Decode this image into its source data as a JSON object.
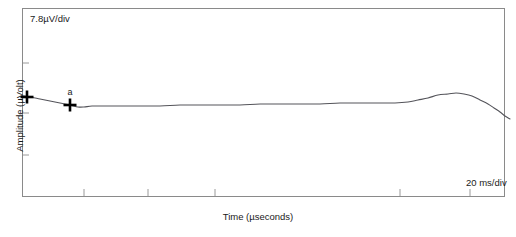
{
  "chart_data": {
    "type": "line",
    "title": "",
    "xlabel": "Time (µseconds)",
    "ylabel": "Amplitude (µVolt)",
    "vertical_scale_note": "7.8µV/div",
    "horizontal_scale_note": "20 ms/div",
    "grid": false,
    "legend": "none",
    "trace_color": "#54545a",
    "frame_color": "#8a8a8a",
    "background_color": "#ffffff",
    "xlim": [
      0,
      100
    ],
    "ylim": [
      -5,
      5
    ],
    "axis_ticks": {
      "y_tick_positions_px": [
        63,
        97,
        113,
        155
      ],
      "x_tick_positions_px": [
        84,
        148,
        215,
        400,
        470
      ]
    },
    "series": [
      {
        "name": "waveform",
        "points_px": [
          [
            23,
            96
          ],
          [
            30,
            97
          ],
          [
            40,
            99
          ],
          [
            50,
            101
          ],
          [
            60,
            103
          ],
          [
            70,
            105
          ],
          [
            78,
            107
          ],
          [
            84,
            107
          ],
          [
            92,
            106
          ],
          [
            104,
            106
          ],
          [
            120,
            106
          ],
          [
            140,
            106
          ],
          [
            160,
            106
          ],
          [
            180,
            105
          ],
          [
            200,
            105
          ],
          [
            220,
            105
          ],
          [
            240,
            105
          ],
          [
            260,
            104
          ],
          [
            280,
            104
          ],
          [
            300,
            104
          ],
          [
            320,
            104
          ],
          [
            340,
            103
          ],
          [
            360,
            103
          ],
          [
            380,
            103
          ],
          [
            395,
            103
          ],
          [
            408,
            102
          ],
          [
            418,
            100
          ],
          [
            428,
            98
          ],
          [
            438,
            95
          ],
          [
            448,
            94
          ],
          [
            456,
            93
          ],
          [
            464,
            94
          ],
          [
            472,
            96
          ],
          [
            480,
            100
          ],
          [
            488,
            104
          ],
          [
            494,
            108
          ],
          [
            500,
            112
          ],
          [
            505,
            116
          ],
          [
            510,
            119
          ]
        ]
      }
    ],
    "markers": [
      {
        "name": "cursor-reference",
        "label": "",
        "x_px": 27,
        "y_px": 97,
        "style": "cross"
      },
      {
        "name": "cursor-a",
        "label": "a",
        "x_px": 70,
        "y_px": 105,
        "label_x_px": 70,
        "label_y_px": 95,
        "style": "cross"
      }
    ]
  }
}
